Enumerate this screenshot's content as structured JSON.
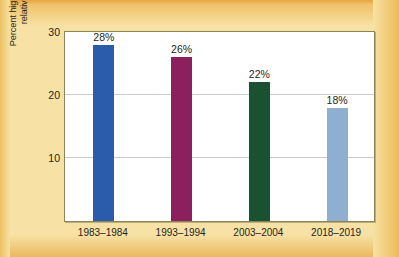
{
  "chart_data": {
    "type": "bar",
    "title": "",
    "subtitle": "",
    "xlabel": "",
    "ylabel": "Percent higher wages of private union workers\nrelative to similar nonunion workers",
    "categories": [
      "1983–1984",
      "1993–1994",
      "2003–2004",
      "2018–2019"
    ],
    "values": [
      28,
      26,
      22,
      18
    ],
    "data_labels": [
      "28%",
      "26%",
      "22%",
      "18%"
    ],
    "ylim": [
      0,
      30
    ],
    "yticks": [
      10,
      20,
      30
    ],
    "ytick_labels": [
      "10",
      "20",
      "30"
    ],
    "grid": true,
    "grid_axis": "y",
    "legend": false,
    "legend_position": "none",
    "bar_colors": [
      "#2a5cab",
      "#8c1f5e",
      "#1a5130",
      "#8fafd0"
    ],
    "series": [
      {
        "name": "Union wage premium",
        "values": [
          28,
          26,
          22,
          18
        ]
      }
    ]
  },
  "figure": {
    "background_color": "#f7e1a4",
    "plot_background_color": "#ffffff",
    "frame_color": "#8a8558",
    "gridline_color": "#c9cbd0",
    "text_color": "#231f20"
  }
}
